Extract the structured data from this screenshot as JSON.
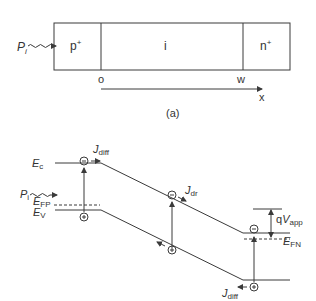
{
  "top": {
    "input_label": "P",
    "input_sub": "i",
    "regions": [
      "p",
      "i",
      "n"
    ],
    "region_sup": [
      "+",
      "",
      "+"
    ],
    "x_origin": "o",
    "x_end": "w",
    "axis_label": "x",
    "caption": "(a)"
  },
  "band": {
    "ec": {
      "main": "E",
      "sub": "c"
    },
    "ev": {
      "main": "E",
      "sub": "V"
    },
    "efp": {
      "main": "E",
      "sub": "FP"
    },
    "efn": {
      "main": "E",
      "sub": "FN"
    },
    "input": {
      "main": "P",
      "sub": "i"
    },
    "jdiff_top": {
      "main": "J",
      "sub": "diff"
    },
    "jdr": {
      "main": "J",
      "sub": "dr"
    },
    "jdiff_bottom": {
      "main": "J",
      "sub": "diff"
    },
    "qvapp": {
      "pre": "q",
      "main": "V",
      "sub": "app"
    },
    "electron": "−",
    "hole": "+"
  },
  "colors": {
    "line": "#3a3a3a",
    "text": "#333333"
  }
}
